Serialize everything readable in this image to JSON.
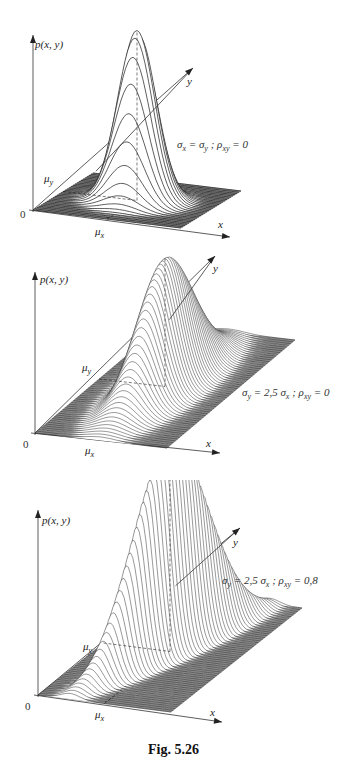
{
  "figure": {
    "caption": "Fig. 5.26",
    "axis_labels": {
      "z": "p(x, y)",
      "x": "x",
      "y": "y",
      "origin": "0",
      "mu_x": "μx",
      "mu_y": "μy"
    }
  },
  "chart_data": [
    {
      "type": "surface",
      "title": "Bivariate normal density",
      "annotation": "σx = σy ; ρxy = 0",
      "annotation_parts": {
        "a": "σ",
        "a_sub": "x",
        "b": " = σ",
        "b_sub": "y",
        "c": " ; ρ",
        "c_sub": "xy",
        "d": " = 0"
      },
      "params": {
        "sigma_x": 1.0,
        "sigma_y": 1.0,
        "rho_xy": 0.0
      }
    },
    {
      "type": "surface",
      "title": "Bivariate normal density",
      "annotation": "σy = 2,5 σx ; ρxy = 0",
      "annotation_parts": {
        "a": "σ",
        "a_sub": "y",
        "b": " = 2,5 σ",
        "b_sub": "x",
        "c": " ; ρ",
        "c_sub": "xy",
        "d": " = 0"
      },
      "params": {
        "sigma_x": 1.0,
        "sigma_y": 2.5,
        "rho_xy": 0.0
      }
    },
    {
      "type": "surface",
      "title": "Bivariate normal density",
      "annotation": "σy = 2,5 σx ; ρxy = 0,8",
      "annotation_parts": {
        "a": "σ",
        "a_sub": "y",
        "b": " = 2,5 σ",
        "b_sub": "x",
        "c": " ; ρ",
        "c_sub": "xy",
        "d": " = 0,8"
      },
      "params": {
        "sigma_x": 1.0,
        "sigma_y": 2.5,
        "rho_xy": 0.8
      }
    }
  ],
  "colors": {
    "plane": "#8a8a8a",
    "lines": "#1a1a1a",
    "surface": "#ffffff",
    "axis": "#333333"
  }
}
